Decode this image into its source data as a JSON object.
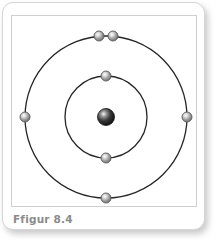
{
  "figure": {
    "caption": "Ffigur 8.4",
    "background_color": "#ffffff",
    "card_border_color": "#d6d6d6",
    "plate_border_color": "#cfcfcf",
    "caption_color": "#8b8b8b"
  },
  "diagram": {
    "type": "bohr-atom-model",
    "center": {
      "x": 94,
      "y": 101
    },
    "nucleus": {
      "label": "nucleus",
      "radius": 8.5,
      "fill_dark": "#1c1c1c",
      "fill_light": "#f2f2f2",
      "stroke": "#111111"
    },
    "electron": {
      "label": "electron",
      "radius": 5.0,
      "fill_dark": "#7d7d7d",
      "fill_light": "#e8e8e8",
      "stroke": "#5a5a5a"
    },
    "shells": [
      {
        "name": "inner-shell",
        "index": 1,
        "radius": 41,
        "stroke": "#262626",
        "stroke_width": 1.3,
        "electron_count": 2,
        "electrons": [
          {
            "name": "inner-electron-top",
            "angle_deg": 270,
            "x": 94,
            "y": 60
          },
          {
            "name": "inner-electron-bottom",
            "angle_deg": 90,
            "x": 94,
            "y": 142
          }
        ]
      },
      {
        "name": "outer-shell",
        "index": 2,
        "radius": 81,
        "stroke": "#262626",
        "stroke_width": 1.3,
        "electron_count": 5,
        "electrons": [
          {
            "name": "outer-electron-top-left",
            "angle_deg": 265,
            "x": 87,
            "y": 20
          },
          {
            "name": "outer-electron-top-right",
            "angle_deg": 275,
            "x": 101,
            "y": 20
          },
          {
            "name": "outer-electron-left",
            "angle_deg": 180,
            "x": 13,
            "y": 101
          },
          {
            "name": "outer-electron-right",
            "angle_deg": 0,
            "x": 175,
            "y": 101
          },
          {
            "name": "outer-electron-bottom",
            "angle_deg": 90,
            "x": 94,
            "y": 182
          }
        ]
      }
    ],
    "total_electrons": 7
  }
}
